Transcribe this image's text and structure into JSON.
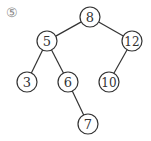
{
  "label": "⑤",
  "nodes": [
    {
      "id": "n8",
      "value": "8",
      "x": 90,
      "y": 17
    },
    {
      "id": "n5",
      "value": "5",
      "x": 47,
      "y": 41
    },
    {
      "id": "n12",
      "value": "12",
      "x": 132,
      "y": 41
    },
    {
      "id": "n3",
      "value": "3",
      "x": 27,
      "y": 82
    },
    {
      "id": "n6",
      "value": "6",
      "x": 68,
      "y": 82
    },
    {
      "id": "n10",
      "value": "10",
      "x": 109,
      "y": 82
    },
    {
      "id": "n7",
      "value": "7",
      "x": 88,
      "y": 124
    }
  ],
  "edges": [
    [
      "n8",
      "n5"
    ],
    [
      "n8",
      "n12"
    ],
    [
      "n5",
      "n3"
    ],
    [
      "n5",
      "n6"
    ],
    [
      "n12",
      "n10"
    ],
    [
      "n6",
      "n7"
    ]
  ],
  "colors": {
    "stroke": "#333333",
    "text": "#333333",
    "label": "#888888"
  }
}
